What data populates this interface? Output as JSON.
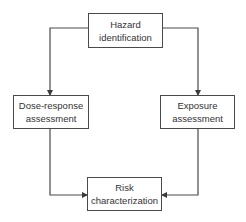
{
  "diagram": {
    "type": "flowchart",
    "nodes": {
      "hazard": {
        "line1": "Hazard",
        "line2": "identification"
      },
      "dose": {
        "line1": "Dose-response",
        "line2": "assessment"
      },
      "exposure": {
        "line1": "Exposure",
        "line2": "assessment"
      },
      "risk": {
        "line1": "Risk",
        "line2": "characterization"
      }
    },
    "edges": [
      {
        "from": "Hazard identification",
        "to": "Dose-response assessment"
      },
      {
        "from": "Hazard identification",
        "to": "Exposure assessment"
      },
      {
        "from": "Dose-response assessment",
        "to": "Risk characterization"
      },
      {
        "from": "Exposure assessment",
        "to": "Risk characterization"
      }
    ],
    "colors": {
      "line": "#4a4a4a",
      "text": "#333333",
      "background": "#ffffff"
    }
  }
}
